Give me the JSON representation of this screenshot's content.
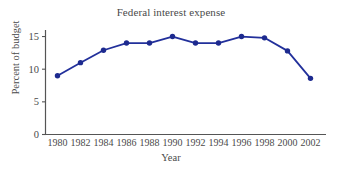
{
  "chart_data": {
    "type": "line",
    "title": "Federal interest expense",
    "xlabel": "Year",
    "ylabel": "Percent of budget",
    "x": [
      1980,
      1982,
      1984,
      1986,
      1988,
      1990,
      1992,
      1994,
      1996,
      1998,
      2000,
      2002
    ],
    "values": [
      9.0,
      11.0,
      12.9,
      14.0,
      14.0,
      15.0,
      14.0,
      14.0,
      15.0,
      14.8,
      12.8,
      8.6
    ],
    "categories": [
      "1980",
      "1982",
      "1984",
      "1986",
      "1988",
      "1990",
      "1992",
      "1994",
      "1996",
      "1998",
      "2000",
      "2002"
    ],
    "xlim": [
      1979,
      2003
    ],
    "ylim": [
      0,
      16
    ],
    "yticks": [
      0,
      5,
      10,
      15
    ],
    "ytick_labels": [
      "0",
      "5",
      "10",
      "15"
    ],
    "xtick_labels": [
      "1980",
      "1982",
      "1984",
      "1986",
      "1988",
      "1990",
      "1992",
      "1994",
      "1996",
      "1998",
      "2000",
      "2002"
    ],
    "grid": false,
    "legend": false,
    "marker": "circle",
    "series": [
      {
        "name": "Federal interest expense",
        "values": [
          9.0,
          11.0,
          12.9,
          14.0,
          14.0,
          15.0,
          14.0,
          14.0,
          15.0,
          14.8,
          12.8,
          8.6
        ]
      }
    ],
    "colors": {
      "line": "#22309b",
      "marker": "#1d2a8f",
      "axis": "#555555",
      "text": "#4a4a4a",
      "background": "#ffffff"
    }
  }
}
